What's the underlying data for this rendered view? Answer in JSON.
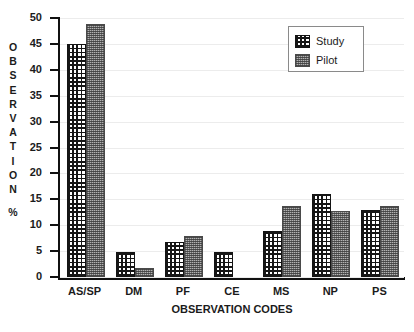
{
  "chart_data": {
    "type": "bar",
    "title": "",
    "xlabel": "OBSERVATION CODES",
    "ylabel": "OBSERVATION %",
    "ylabel_stacked": [
      "O",
      "B",
      "S",
      "E",
      "R",
      "V",
      "A",
      "T",
      "I",
      "O",
      "N",
      "",
      "%"
    ],
    "categories": [
      "AS/SP",
      "DM",
      "PF",
      "CE",
      "MS",
      "NP",
      "PS"
    ],
    "series": [
      {
        "name": "Study",
        "values": [
          45,
          4.8,
          6.8,
          4.8,
          8.8,
          16,
          12.9
        ]
      },
      {
        "name": "Pilot",
        "values": [
          48.8,
          1.8,
          7.9,
          null,
          13.8,
          12.7,
          13.8
        ]
      }
    ],
    "ylim": [
      0,
      50
    ],
    "ytick_labels": [
      "50",
      "45",
      "40",
      "35",
      "30",
      "25",
      "20",
      "15",
      "10",
      "5",
      "0"
    ],
    "ytick_values": [
      50,
      45,
      40,
      35,
      30,
      25,
      20,
      15,
      10,
      5,
      0
    ],
    "ytick_step": 5,
    "grid": true,
    "grid_color": "#ececec",
    "legend_position": "top-right",
    "axis_color": "#111111",
    "series_colors": {
      "Study": "#161616",
      "Pilot": "#b2b2b2"
    }
  },
  "legend": {
    "entries": [
      {
        "label": "Study",
        "swatch": "study-pattern-swatch"
      },
      {
        "label": "Pilot",
        "swatch": "pilot-pattern-swatch"
      }
    ]
  }
}
